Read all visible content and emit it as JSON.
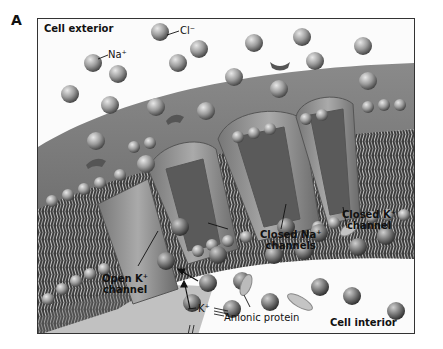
{
  "figure": {
    "panel_letter": "A",
    "labels": {
      "cell_exterior": "Cell exterior",
      "cell_interior": "Cell interior",
      "na_ion": "Na⁺",
      "cl_ion": "Cl⁻",
      "k_ion": "K⁺",
      "closed_na_channels_line1": "Closed Na⁺",
      "closed_na_channels_line2": "channels",
      "closed_k_channel_line1": "Closed K⁺",
      "closed_k_channel_line2": "channel",
      "open_k_channel_line1": "Open K⁺",
      "open_k_channel_line2": "channel",
      "anionic_protein": "Anionic protein"
    },
    "colors": {
      "membrane": "#6e6e6e",
      "ion": "#9a9a9a",
      "background": "#fbfbfb",
      "frame": "#333333"
    }
  }
}
